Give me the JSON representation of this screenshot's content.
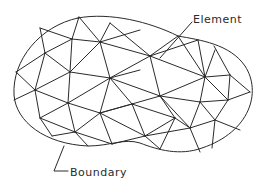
{
  "diagram": {
    "labels": {
      "element": "Element",
      "boundary": "Boundary"
    },
    "colors": {
      "background": "#ffffff",
      "line": "#2a2a2a"
    },
    "boundary_shape": "closed kidney/peanut-shaped curve",
    "mesh_type": "unstructured triangular mesh",
    "annotations": [
      {
        "text": "Element",
        "points_to": "interior triangle near upper right",
        "leader": "straight line from label to triangle interior"
      },
      {
        "text": "Boundary",
        "points_to": "lower boundary curve",
        "leader": "angled line from label to curve"
      }
    ]
  }
}
